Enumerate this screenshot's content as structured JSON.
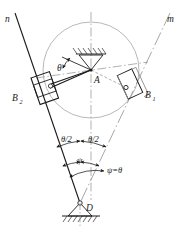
{
  "diagram": {
    "labels": {
      "line_n": "n",
      "line_m": "m",
      "pivot_a": "A",
      "pivot_d": "D",
      "slider_b1": "B",
      "slider_b1_sub": "1",
      "slider_b2": "B",
      "slider_b2_sub": "2",
      "angle_theta": "θ",
      "angle_half_theta_left": "θ/2",
      "angle_half_theta_right": "θ/2",
      "angle_psi": "ψ",
      "relation_psi_theta": "ψ=θ"
    },
    "colors": {
      "stroke_main": "#1a1a1a",
      "stroke_light": "#8c8c8c",
      "stroke_center": "#9a9a9a",
      "background": "#ffffff",
      "text": "#1a1a1a"
    },
    "geometry": {
      "circle_center_x": 91,
      "circle_center_y": 70,
      "circle_radius": 48,
      "pivot_a_x": 91,
      "pivot_a_y": 70,
      "pivot_d_x": 80,
      "pivot_d_y": 203,
      "slider_b1_x": 132,
      "slider_b1_y": 88,
      "slider_b2_x": 44,
      "slider_b2_y": 87
    },
    "elements": {
      "ground_support_top": "fixed-pivot-hatched-support",
      "ground_support_bottom": "fixed-pivot-hatched-ground",
      "centerline_vertical": "dash-dot-centerline",
      "centerline_horizontal": "dash-dot-centerline",
      "arc_theta": "angle-arc-with-arrows",
      "arc_half_theta": "angle-arc-with-arrows",
      "arc_psi": "angle-arc-with-arrows"
    }
  }
}
